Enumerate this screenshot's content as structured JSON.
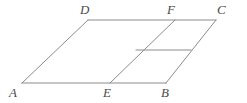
{
  "figure": {
    "background_color": "#ffffff",
    "stroke_color": "#8c8c8c",
    "stroke_width": 1,
    "label_color": "#4a4a4a",
    "view_box": "0 0 247 103",
    "points": {
      "A": {
        "x": 22,
        "y": 83
      },
      "B": {
        "x": 166,
        "y": 83
      },
      "C": {
        "x": 216,
        "y": 20
      },
      "D": {
        "x": 88,
        "y": 20
      },
      "E": {
        "x": 110,
        "y": 83
      },
      "F": {
        "x": 175,
        "y": 20
      },
      "G": {
        "x": 136,
        "y": 50
      },
      "H": {
        "x": 191,
        "y": 50
      }
    },
    "segments": [
      {
        "name": "segment-AB",
        "from": "A",
        "to": "B",
        "x1": 22,
        "y1": 83,
        "x2": 166,
        "y2": 83
      },
      {
        "name": "segment-DC",
        "from": "D",
        "to": "C",
        "x1": 88,
        "y1": 20,
        "x2": 216,
        "y2": 20
      },
      {
        "name": "segment-AD",
        "from": "A",
        "to": "D",
        "x1": 22,
        "y1": 83,
        "x2": 88,
        "y2": 20
      },
      {
        "name": "segment-BC",
        "from": "B",
        "to": "C",
        "x1": 166,
        "y1": 83,
        "x2": 216,
        "y2": 20
      },
      {
        "name": "segment-EF",
        "from": "E",
        "to": "F",
        "x1": 110,
        "y1": 83,
        "x2": 175,
        "y2": 20
      },
      {
        "name": "segment-midline",
        "from": "G",
        "to": "H",
        "x1": 136,
        "y1": 50,
        "x2": 191,
        "y2": 50
      }
    ],
    "labels": [
      {
        "name": "vertex-label-A",
        "text": "A",
        "x": 9,
        "y": 86
      },
      {
        "name": "vertex-label-E",
        "text": "E",
        "x": 103,
        "y": 86
      },
      {
        "name": "vertex-label-B",
        "text": "B",
        "x": 161,
        "y": 86
      },
      {
        "name": "vertex-label-D",
        "text": "D",
        "x": 80,
        "y": 3
      },
      {
        "name": "vertex-label-F",
        "text": "F",
        "x": 167,
        "y": 3
      },
      {
        "name": "vertex-label-C",
        "text": "C",
        "x": 217,
        "y": 3
      }
    ]
  }
}
